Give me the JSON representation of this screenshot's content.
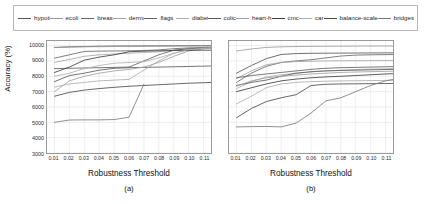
{
  "legend": {
    "entries": [
      {
        "label": "hypothyroid",
        "color": "#555555"
      },
      {
        "label": "ecoli",
        "color": "#9a9a9a"
      },
      {
        "label": "breast-cancer",
        "color": "#666666"
      },
      {
        "label": "dermatology",
        "color": "#a5a5a5"
      },
      {
        "label": "flags",
        "color": "#5f5f5f"
      },
      {
        "label": "diabetes",
        "color": "#b0b0b0"
      },
      {
        "label": "colic",
        "color": "#585858"
      },
      {
        "label": "heart-h",
        "color": "#a0a0a0"
      },
      {
        "label": "cmc",
        "color": "#3d3d3d"
      },
      {
        "label": "car",
        "color": "#acacac"
      },
      {
        "label": "balance-scale",
        "color": "#4a4a4a"
      },
      {
        "label": "bridges",
        "color": "#7a7a7a"
      }
    ]
  },
  "chart_data": [
    {
      "type": "line",
      "title": "",
      "caption": "(a)",
      "xlabel": "Robustness Threshold",
      "ylabel": "Accuracy (%)",
      "xlim": [
        0.005,
        0.115
      ],
      "ylim": [
        3000,
        10300
      ],
      "yticks": [
        3000,
        4000,
        5000,
        6000,
        7000,
        8000,
        9000,
        10000
      ],
      "ytick_labels": [
        "3000",
        "4000",
        "5000",
        "6000",
        "7000",
        "8000",
        "9000",
        "10000"
      ],
      "xticks": [
        0.01,
        0.02,
        0.03,
        0.04,
        0.05,
        0.06,
        0.07,
        0.08,
        0.09,
        0.1,
        0.11
      ],
      "xtick_labels": [
        "0.01",
        "0.02",
        "0.03",
        "0.04",
        "0.05",
        "0.06",
        "0.07",
        "0.08",
        "0.09",
        "0.10",
        "0.11"
      ],
      "grid": true,
      "legend_position": "above-figure",
      "x": [
        0.01,
        0.02,
        0.03,
        0.04,
        0.05,
        0.06,
        0.07,
        0.08,
        0.09,
        0.1,
        0.11,
        0.115
      ],
      "series": [
        {
          "name": "hypothyroid",
          "color": "#555555",
          "values": [
            9880,
            9920,
            9940,
            9960,
            9970,
            9975,
            9980,
            9985,
            9990,
            9995,
            10000,
            10000
          ]
        },
        {
          "name": "ecoli",
          "color": "#9a9a9a",
          "values": [
            9870,
            9900,
            9920,
            9930,
            9940,
            9950,
            9955,
            9960,
            9965,
            9970,
            9975,
            9975
          ]
        },
        {
          "name": "breast-cancer",
          "color": "#666666",
          "values": [
            9180,
            9400,
            9620,
            9640,
            9650,
            9660,
            9680,
            9720,
            9800,
            9850,
            9880,
            9890
          ]
        },
        {
          "name": "dermatology",
          "color": "#a5a5a5",
          "values": [
            8900,
            9100,
            9300,
            9400,
            9450,
            9500,
            9550,
            9600,
            9700,
            9780,
            9840,
            9860
          ]
        },
        {
          "name": "flags",
          "color": "#5f5f5f",
          "values": [
            8500,
            8520,
            8540,
            8560,
            8580,
            8600,
            9000,
            9400,
            9700,
            9800,
            9830,
            9840
          ]
        },
        {
          "name": "diabetes",
          "color": "#b0b0b0",
          "values": [
            8000,
            8200,
            8500,
            8700,
            8850,
            8900,
            8950,
            9200,
            9500,
            9700,
            9800,
            9820
          ]
        },
        {
          "name": "colic",
          "color": "#585858",
          "values": [
            7650,
            8050,
            8200,
            8400,
            8520,
            8560,
            8580,
            8600,
            8620,
            8640,
            8660,
            8670
          ]
        },
        {
          "name": "heart-h",
          "color": "#a0a0a0",
          "values": [
            7000,
            7700,
            8000,
            8200,
            8350,
            8450,
            8600,
            8900,
            9300,
            9650,
            9800,
            9830
          ]
        },
        {
          "name": "cmc",
          "color": "#3d3d3d",
          "values": [
            8250,
            8600,
            9050,
            9250,
            9400,
            9600,
            9640,
            9660,
            9680,
            9690,
            9700,
            9700
          ]
        },
        {
          "name": "car",
          "color": "#acacac",
          "values": [
            7300,
            7500,
            7600,
            7700,
            7750,
            7800,
            8400,
            9000,
            9500,
            9750,
            9820,
            9840
          ]
        },
        {
          "name": "balance-scale",
          "color": "#4a4a4a",
          "values": [
            6700,
            6950,
            7100,
            7200,
            7280,
            7350,
            7400,
            7450,
            7500,
            7550,
            7580,
            7600
          ]
        },
        {
          "name": "bridges",
          "color": "#7a7a7a",
          "values": [
            5000,
            5150,
            5160,
            5160,
            5180,
            5330,
            7480,
            null,
            null,
            null,
            null,
            null
          ]
        }
      ]
    },
    {
      "type": "line",
      "title": "",
      "caption": "(b)",
      "xlabel": "Robustness Threshold",
      "ylabel": "",
      "xlim": [
        0.005,
        0.115
      ],
      "ylim": [
        3000,
        10300
      ],
      "yticks": [
        3000,
        4000,
        5000,
        6000,
        7000,
        8000,
        9000,
        10000
      ],
      "ytick_labels": [],
      "xticks": [
        0.01,
        0.02,
        0.03,
        0.04,
        0.05,
        0.06,
        0.07,
        0.08,
        0.09,
        0.1,
        0.11
      ],
      "xtick_labels": [
        "0.01",
        "0.02",
        "0.03",
        "0.04",
        "0.05",
        "0.06",
        "0.07",
        "0.08",
        "0.09",
        "0.10",
        "0.11"
      ],
      "grid": true,
      "legend_position": "above-figure",
      "x": [
        0.01,
        0.02,
        0.03,
        0.04,
        0.05,
        0.06,
        0.07,
        0.08,
        0.09,
        0.1,
        0.11,
        0.115
      ],
      "series": [
        {
          "name": "hypothyroid",
          "color": "#9a9a9a",
          "values": [
            9650,
            9780,
            9880,
            9920,
            9940,
            9950,
            9955,
            9960,
            9965,
            9970,
            9975,
            9975
          ]
        },
        {
          "name": "ecoli",
          "color": "#555555",
          "values": [
            8200,
            8700,
            9150,
            9420,
            9480,
            9500,
            9505,
            9510,
            9515,
            9520,
            9525,
            9525
          ]
        },
        {
          "name": "breast-cancer",
          "color": "#666666",
          "values": [
            7600,
            8200,
            8650,
            8900,
            9000,
            9080,
            9200,
            9320,
            9380,
            9400,
            9410,
            9415
          ]
        },
        {
          "name": "dermatology",
          "color": "#a5a5a5",
          "values": [
            7850,
            8350,
            8750,
            8900,
            8960,
            8980,
            9000,
            9010,
            9015,
            9020,
            9025,
            9025
          ]
        },
        {
          "name": "flags",
          "color": "#5f5f5f",
          "values": [
            7900,
            8050,
            8150,
            8250,
            8350,
            8450,
            8520,
            8560,
            8580,
            8600,
            8620,
            8630
          ]
        },
        {
          "name": "diabetes",
          "color": "#b0b0b0",
          "values": [
            7200,
            7650,
            7950,
            8100,
            8200,
            8280,
            8350,
            8400,
            8440,
            8470,
            8490,
            8500
          ]
        },
        {
          "name": "colic",
          "color": "#585858",
          "values": [
            7400,
            7600,
            7750,
            8000,
            8200,
            8300,
            8350,
            8380,
            8400,
            8420,
            8440,
            8450
          ]
        },
        {
          "name": "heart-h",
          "color": "#a0a0a0",
          "values": [
            7350,
            7700,
            7900,
            8000,
            8080,
            8150,
            8200,
            8250,
            8280,
            8300,
            8320,
            8330
          ]
        },
        {
          "name": "cmc",
          "color": "#3d3d3d",
          "values": [
            7000,
            7250,
            7500,
            7700,
            7820,
            7900,
            7960,
            8000,
            8050,
            8100,
            8150,
            8170
          ]
        },
        {
          "name": "car",
          "color": "#acacac",
          "values": [
            6200,
            6700,
            7250,
            7500,
            7600,
            7650,
            7680,
            7700,
            7710,
            7720,
            7730,
            7735
          ]
        },
        {
          "name": "balance-scale",
          "color": "#4a4a4a",
          "values": [
            5300,
            5900,
            6350,
            6600,
            6800,
            7400,
            7480,
            7500,
            7510,
            7520,
            7530,
            7535
          ]
        },
        {
          "name": "bridges",
          "color": "#7a7a7a",
          "values": [
            4700,
            4720,
            4730,
            4700,
            4950,
            5600,
            6400,
            6600,
            7000,
            7400,
            7700,
            7800
          ]
        }
      ]
    }
  ]
}
